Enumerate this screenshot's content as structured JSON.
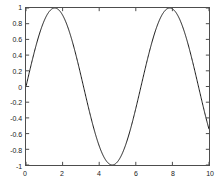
{
  "chart_data": {
    "type": "line",
    "title": "",
    "subtitle": "",
    "xlabel": "",
    "ylabel": "",
    "xlim": [
      0,
      10
    ],
    "ylim": [
      -1,
      1
    ],
    "grid": false,
    "legend": null,
    "box": true,
    "tick_direction": "in",
    "line_color": "#1a1a1a",
    "axis_color": "#4d4d4d",
    "background_color": "#ffffff",
    "xticks": [
      0,
      2,
      4,
      6,
      8,
      10
    ],
    "xticklabels": [
      "0",
      "2",
      "4",
      "6",
      "8",
      "10"
    ],
    "yticks": [
      -1,
      -0.8,
      -0.6,
      -0.4,
      -0.2,
      0,
      0.2,
      0.4,
      0.6,
      0.8,
      1
    ],
    "yticklabels": [
      "-1",
      "-0.8",
      "-0.6",
      "-0.4",
      "-0.2",
      "0",
      "0.2",
      "0.4",
      "0.6",
      "0.8",
      "1"
    ],
    "series": [
      {
        "name": "sin(x)",
        "function": "sin",
        "x": [
          0,
          0.2,
          0.4,
          0.6,
          0.8,
          1,
          1.2,
          1.4,
          1.5708,
          1.8,
          2,
          2.2,
          2.4,
          2.6,
          2.8,
          3,
          3.1416,
          3.4,
          3.6,
          3.8,
          4,
          4.2,
          4.4,
          4.6,
          4.7124,
          5,
          5.2,
          5.4,
          5.6,
          5.8,
          6,
          6.2,
          6.2832,
          6.6,
          6.8,
          7,
          7.2,
          7.4,
          7.6,
          7.8,
          7.854,
          8.2,
          8.4,
          8.6,
          8.8,
          9,
          9.2,
          9.4248,
          9.6,
          9.8,
          10
        ],
        "y": [
          0,
          0.1987,
          0.3894,
          0.5646,
          0.7174,
          0.8415,
          0.932,
          0.9854,
          1,
          0.9738,
          0.9093,
          0.8085,
          0.6755,
          0.5155,
          0.335,
          0.1411,
          0,
          -0.2555,
          -0.4425,
          -0.6119,
          -0.7568,
          -0.8716,
          -0.9516,
          -0.9937,
          -1,
          -0.9589,
          -0.8835,
          -0.7728,
          -0.6313,
          -0.4646,
          -0.2794,
          -0.0831,
          0,
          0.3115,
          0.4941,
          0.657,
          0.7937,
          0.8987,
          0.9679,
          0.9989,
          1,
          0.9407,
          0.8546,
          0.7344,
          0.5849,
          0.4121,
          0.2229,
          0,
          -0.1743,
          -0.366,
          -0.544
        ]
      }
    ]
  },
  "axes": {
    "x_axis_name": "x-axis",
    "y_axis_name": "y-axis"
  }
}
